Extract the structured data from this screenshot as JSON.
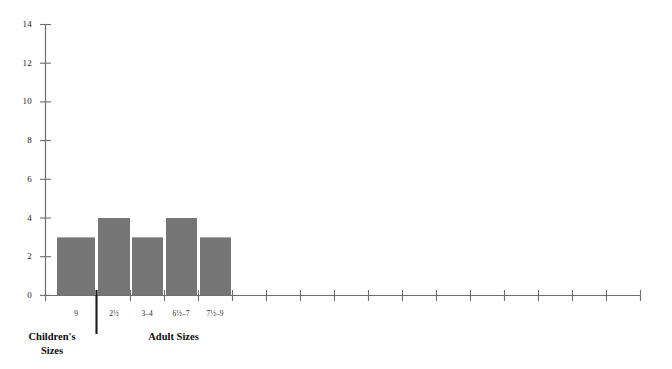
{
  "chart_data": {
    "type": "bar",
    "title": "",
    "subtitle": "",
    "xlabel": "",
    "ylabel": "",
    "categories": [
      "9",
      "2½",
      "3–4",
      "6½–7",
      "7½–9"
    ],
    "values": [
      1,
      1,
      3,
      4,
      3
    ],
    "ylim": [
      0,
      14
    ],
    "y_ticks": [
      "0",
      "2",
      "4",
      "6",
      "8",
      "10",
      "12",
      "14"
    ],
    "y_tick_values": [
      0,
      2,
      4,
      6,
      8,
      10,
      12,
      14
    ],
    "grid": false,
    "legend": "none",
    "bar_color": "#757575",
    "axis_color": "#6e6e6e",
    "text_color": "#1a1a1a",
    "series": [
      {
        "name": "Shoe size frequency",
        "values": [
          1,
          1,
          3,
          4,
          3
        ]
      }
    ],
    "groups": [
      {
        "name": "children",
        "label_lines": [
          "Children's",
          "Sizes"
        ],
        "categories": [
          "9",
          "2½"
        ]
      },
      {
        "name": "adult",
        "label_lines": [
          "Adult Sizes"
        ],
        "categories": [
          "3–4",
          "6½–7",
          "7½–9"
        ]
      }
    ],
    "empty_tick_count": 16,
    "annotations": [
      {
        "name": "group-divider",
        "type": "vertical-line"
      }
    ]
  },
  "axis": {
    "y_tick_0": "0",
    "y_tick_2": "2",
    "y_tick_4": "4",
    "y_tick_6": "6",
    "y_tick_8": "8",
    "y_tick_10": "10",
    "y_tick_12": "12",
    "y_tick_14": "14"
  },
  "x_labels": {
    "cat_0": "9",
    "cat_1": "2½",
    "cat_2": "3–4",
    "cat_3": "6½–7",
    "cat_4": "7½–9"
  },
  "captions": {
    "children_line1": "Children's",
    "children_line2": "Sizes",
    "adult_line1": "Adult Sizes"
  }
}
